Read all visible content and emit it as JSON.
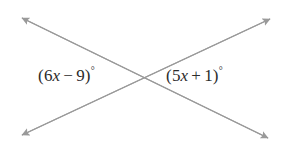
{
  "figure": {
    "background_color": "#ffffff",
    "line_color": "#9a9a9a",
    "text_color": "#2b2b2b",
    "line_width": 1.2
  },
  "lines": [
    {
      "name": "line-top-left-to-bottom-right",
      "from": {
        "x": 22,
        "y": 18
      },
      "to": {
        "x": 268,
        "y": 138
      },
      "arrow_start": true,
      "arrow_end": true
    },
    {
      "name": "line-bottom-left-to-top-right",
      "from": {
        "x": 22,
        "y": 135
      },
      "to": {
        "x": 270,
        "y": 19
      },
      "arrow_start": true,
      "arrow_end": true
    }
  ],
  "intersection": {
    "x": 145,
    "y": 77
  },
  "arrowheads": [
    {
      "name": "arrowhead-top-left",
      "x": 22,
      "y": 18
    },
    {
      "name": "arrowhead-top-right",
      "x": 270,
      "y": 19
    },
    {
      "name": "arrowhead-bottom-left",
      "x": 22,
      "y": 135
    },
    {
      "name": "arrowhead-bottom-right",
      "x": 268,
      "y": 138
    }
  ],
  "labels": {
    "left_angle": {
      "full_text": "(6x − 9)°",
      "open_paren": "(",
      "coefficient": "6",
      "variable": "x",
      "operator": "−",
      "constant": "9",
      "close_paren": ")",
      "degree": "°",
      "expression": "6x - 9",
      "position": "left"
    },
    "right_angle": {
      "full_text": "(5x + 1)°",
      "open_paren": "(",
      "coefficient": "5",
      "variable": "x",
      "operator": "+",
      "constant": "1",
      "close_paren": ")",
      "degree": "°",
      "expression": "5x + 1",
      "position": "right"
    }
  }
}
